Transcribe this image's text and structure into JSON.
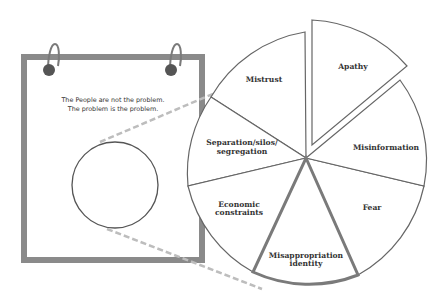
{
  "notepad": {
    "line1": "The People are not the problem.",
    "line2": "The problem is the problem."
  },
  "pie": {
    "slices": [
      {
        "label": "Apathy",
        "exploded": true,
        "highlight": false
      },
      {
        "label": "Misinformation",
        "exploded": false,
        "highlight": false
      },
      {
        "label": "Fear",
        "exploded": false,
        "highlight": false
      },
      {
        "label": "Misappropriation",
        "label2": "identity",
        "exploded": false,
        "highlight": true
      },
      {
        "label": "Economic",
        "label2": "constraints",
        "exploded": false,
        "highlight": false
      },
      {
        "label": "Separation/silos/",
        "label2": "segregation",
        "exploded": false,
        "highlight": false
      },
      {
        "label": "Mistrust",
        "exploded": false,
        "highlight": false
      }
    ]
  },
  "colors": {
    "notepad_border": "#8a8a8a",
    "ring": "#5a5a5a",
    "ring_wire": "#7a7a7a",
    "slice_stroke": "#666666",
    "highlight_stroke": "#7a7a7a",
    "dash": "#bdbdbd"
  }
}
